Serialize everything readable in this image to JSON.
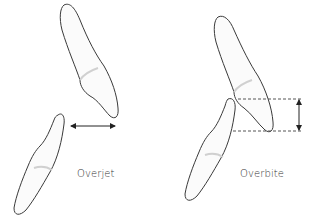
{
  "diagram": {
    "panels": [
      {
        "id": "overjet",
        "label": "Overjet",
        "measurement": "horizontal"
      },
      {
        "id": "overbite",
        "label": "Overbite",
        "measurement": "vertical"
      }
    ],
    "colors": {
      "outline": "#3a3a3a",
      "fill": "#fbfbfb",
      "shade": "#d8d8d8",
      "arrow": "#222222",
      "dashed": "#555555"
    }
  }
}
